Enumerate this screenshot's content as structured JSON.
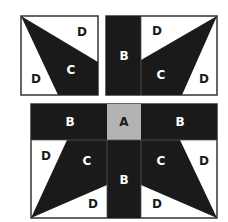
{
  "colors": {
    "dark": "#1a1a1a",
    "light": "#ffffff",
    "gray": "#b3b3b3",
    "border": "#333333"
  },
  "top_left_block": {
    "labels": {
      "d_upper": "D",
      "c": "C",
      "d_lower": "D"
    }
  },
  "top_right_block": {
    "labels": {
      "b": "B",
      "d_upper": "D",
      "c": "C",
      "d_lower": "D"
    }
  },
  "bottom_block": {
    "labels": {
      "b_left": "B",
      "a": "A",
      "b_right": "B",
      "d_left": "D",
      "c_left": "C",
      "b_center": "B",
      "c_right": "C",
      "d_right": "D",
      "d_bottom_left": "D",
      "d_bottom_right": "D"
    }
  }
}
